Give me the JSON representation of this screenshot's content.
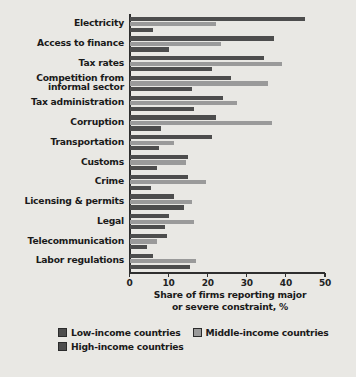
{
  "chart_data": {
    "type": "bar",
    "orientation": "horizontal",
    "title": "",
    "xlabel": "Share of firms reporting major or severe constraint, %",
    "ylabel": "",
    "xlim": [
      0,
      50
    ],
    "xticks": [
      0,
      10,
      20,
      30,
      40,
      50
    ],
    "xtick_labels": [
      "0",
      "10",
      "20",
      "30",
      "40",
      "50"
    ],
    "grid": false,
    "legend_position": "bottom",
    "categories": [
      "Electricity",
      "Access to finance",
      "Tax rates",
      "Competition from informal sector",
      "Tax administration",
      "Corruption",
      "Transportation",
      "Customs",
      "Crime",
      "Licensing & permits",
      "Legal",
      "Telecommunication",
      "Labor regulations"
    ],
    "category_lines": [
      [
        "Electricity"
      ],
      [
        "Access to finance"
      ],
      [
        "Tax rates"
      ],
      [
        "Competition from",
        "informal sector"
      ],
      [
        "Tax administration"
      ],
      [
        "Corruption"
      ],
      [
        "Transportation"
      ],
      [
        "Customs"
      ],
      [
        "Crime"
      ],
      [
        "Licensing & permits"
      ],
      [
        "Legal"
      ],
      [
        "Telecommunication"
      ],
      [
        "Labor regulations"
      ]
    ],
    "series": [
      {
        "name": "Low-income countries",
        "color": "#4d4d4d",
        "values": [
          45.0,
          37.0,
          34.5,
          26.0,
          24.0,
          22.0,
          21.0,
          15.0,
          15.0,
          11.5,
          10.0,
          9.5,
          6.0
        ]
      },
      {
        "name": "Middle-income countries",
        "color": "#9a9a9a",
        "values": [
          22.0,
          23.5,
          39.0,
          35.5,
          27.5,
          36.5,
          11.5,
          14.5,
          19.5,
          16.0,
          16.5,
          7.0,
          17.0
        ]
      },
      {
        "name": "High-income countries",
        "color": "#4d4d4d",
        "values": [
          6.0,
          10.0,
          21.0,
          16.0,
          16.5,
          8.0,
          7.5,
          7.0,
          5.5,
          14.0,
          9.0,
          4.5,
          15.5
        ]
      }
    ]
  },
  "legend": {
    "items": [
      {
        "label": "Low-income countries",
        "swatch": "low"
      },
      {
        "label": "Middle-income countries",
        "swatch": "middle"
      },
      {
        "label": "High-income countries",
        "swatch": "high"
      }
    ]
  },
  "axis": {
    "title_line1": "Share of firms reporting major",
    "title_line2": "or severe constraint, %"
  }
}
